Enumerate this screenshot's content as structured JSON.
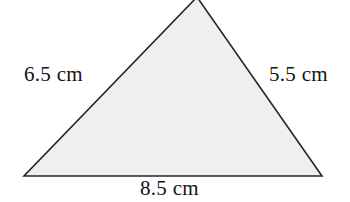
{
  "figure": {
    "shape": "triangle",
    "background_color": "#ffffff",
    "fill_color": "#efefef",
    "stroke_color": "#26262a",
    "stroke_width": 1.6,
    "vertices": {
      "apex": {
        "x": 197,
        "y": -3
      },
      "bottom_left": {
        "x": 24,
        "y": 176
      },
      "bottom_right": {
        "x": 322,
        "y": 176
      }
    },
    "labels": {
      "left_side": "6.5 cm",
      "right_side": "5.5 cm",
      "bottom_side": "8.5 cm"
    },
    "measurements": [
      {
        "side": "left",
        "value": 6.5,
        "unit": "cm"
      },
      {
        "side": "right",
        "value": 5.5,
        "unit": "cm"
      },
      {
        "side": "bottom",
        "value": 8.5,
        "unit": "cm"
      }
    ]
  }
}
